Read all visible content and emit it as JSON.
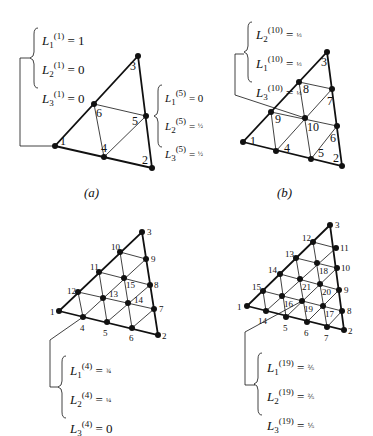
{
  "figures": [
    {
      "id": "a",
      "caption": "(a)",
      "nodes": [
        {
          "label": "1",
          "x": 55,
          "y": 146,
          "lx": 60,
          "ly": 145
        },
        {
          "label": "2",
          "x": 152,
          "y": 168,
          "lx": 142,
          "ly": 164
        },
        {
          "label": "3",
          "x": 138,
          "y": 56,
          "lx": 130,
          "ly": 70
        },
        {
          "label": "4",
          "x": 104,
          "y": 157,
          "lx": 101,
          "ly": 152
        },
        {
          "label": "5",
          "x": 146,
          "y": 116,
          "lx": 132,
          "ly": 125
        },
        {
          "label": "6",
          "x": 94,
          "y": 104,
          "lx": 96,
          "ly": 117
        }
      ],
      "equations_top": [
        {
          "base": "L",
          "sub": "1",
          "sup": "(1)",
          "value": "1"
        },
        {
          "base": "L",
          "sub": "2",
          "sup": "(1)",
          "value": "0"
        },
        {
          "base": "L",
          "sub": "3",
          "sup": "(1)",
          "value": "0"
        }
      ],
      "equations_side": [
        {
          "base": "L",
          "sub": "1",
          "sup": "(5)",
          "value": "0"
        },
        {
          "base": "L",
          "sub": "2",
          "sup": "(5)",
          "value": "½"
        },
        {
          "base": "L",
          "sub": "3",
          "sup": "(5)",
          "value": "½"
        }
      ]
    },
    {
      "id": "b",
      "caption": "(b)",
      "nodes": [
        {
          "label": "1",
          "x": 243,
          "y": 142,
          "lx": 250,
          "ly": 145
        },
        {
          "label": "2",
          "x": 342,
          "y": 166,
          "lx": 333,
          "ly": 162
        },
        {
          "label": "3",
          "x": 327,
          "y": 52,
          "lx": 321,
          "ly": 66
        },
        {
          "label": "4",
          "x": 276,
          "y": 151,
          "lx": 284,
          "ly": 152
        },
        {
          "label": "5",
          "x": 311,
          "y": 159,
          "lx": 318,
          "ly": 157
        },
        {
          "label": "6",
          "x": 337,
          "y": 126,
          "lx": 330,
          "ly": 142
        },
        {
          "label": "7",
          "x": 332,
          "y": 89,
          "lx": 327,
          "ly": 105
        },
        {
          "label": "8",
          "x": 299,
          "y": 82,
          "lx": 303,
          "ly": 93
        },
        {
          "label": "9",
          "x": 271,
          "y": 112,
          "lx": 275,
          "ly": 123
        },
        {
          "label": "10",
          "x": 305,
          "y": 118,
          "lx": 307,
          "ly": 131
        }
      ],
      "equations_top": [
        {
          "base": "L",
          "sub": "2",
          "sup": "(10)",
          "value": "⅓"
        },
        {
          "base": "L",
          "sub": "1",
          "sup": "(10)",
          "value": "⅓"
        },
        {
          "base": "L",
          "sub": "3",
          "sup": "(10)",
          "value": "⅓"
        }
      ]
    },
    {
      "id": "c",
      "caption": "",
      "nodes": [
        {
          "label": "1",
          "x": 59,
          "y": 311,
          "lx": 50,
          "ly": 315
        },
        {
          "label": "2",
          "x": 158,
          "y": 335,
          "lx": 162,
          "ly": 339
        },
        {
          "label": "3",
          "x": 142,
          "y": 232,
          "lx": 147,
          "ly": 235
        },
        {
          "label": "4",
          "x": 83,
          "y": 317,
          "lx": 80,
          "ly": 331
        },
        {
          "label": "5",
          "x": 107,
          "y": 322,
          "lx": 103,
          "ly": 336
        },
        {
          "label": "6",
          "x": 132,
          "y": 328,
          "lx": 129,
          "ly": 341
        },
        {
          "label": "7",
          "x": 154,
          "y": 309,
          "lx": 159,
          "ly": 312
        },
        {
          "label": "8",
          "x": 150,
          "y": 285,
          "lx": 154,
          "ly": 288
        },
        {
          "label": "9",
          "x": 146,
          "y": 259,
          "lx": 151,
          "ly": 262
        },
        {
          "label": "10",
          "x": 120,
          "y": 252,
          "lx": 111,
          "ly": 250
        },
        {
          "label": "11",
          "x": 99,
          "y": 272,
          "lx": 90,
          "ly": 270
        },
        {
          "label": "12",
          "x": 78,
          "y": 292,
          "lx": 67,
          "ly": 294
        },
        {
          "label": "13",
          "x": 103,
          "y": 298,
          "lx": 109,
          "ly": 297
        },
        {
          "label": "14",
          "x": 128,
          "y": 303,
          "lx": 134,
          "ly": 303
        },
        {
          "label": "15",
          "x": 124,
          "y": 278,
          "lx": 126,
          "ly": 288
        }
      ],
      "equations_bottom": [
        {
          "base": "L",
          "sub": "1",
          "sup": "(4)",
          "value": "¾"
        },
        {
          "base": "L",
          "sub": "2",
          "sup": "(4)",
          "value": "¼"
        },
        {
          "base": "L",
          "sub": "3",
          "sup": "(4)",
          "value": "0"
        }
      ]
    },
    {
      "id": "d",
      "caption": "",
      "nodes": [
        {
          "label": "1",
          "x": 247,
          "y": 306,
          "lx": 237,
          "ly": 310
        },
        {
          "label": "2",
          "x": 344,
          "y": 330,
          "lx": 348,
          "ly": 334
        },
        {
          "label": "3",
          "x": 330,
          "y": 225,
          "lx": 335,
          "ly": 228
        },
        {
          "label": "14",
          "x": 266,
          "y": 311,
          "lx": 258,
          "ly": 324
        },
        {
          "label": "5",
          "x": 286,
          "y": 317,
          "lx": 283,
          "ly": 331
        },
        {
          "label": "6",
          "x": 307,
          "y": 322,
          "lx": 304,
          "ly": 336
        },
        {
          "label": "7",
          "x": 327,
          "y": 327,
          "lx": 324,
          "ly": 341
        },
        {
          "label": "8",
          "x": 342,
          "y": 311,
          "lx": 347,
          "ly": 314
        },
        {
          "label": "9",
          "x": 339,
          "y": 290,
          "lx": 344,
          "ly": 293
        },
        {
          "label": "10",
          "x": 337,
          "y": 268,
          "lx": 341,
          "ly": 271
        },
        {
          "label": "11",
          "x": 336,
          "y": 248,
          "lx": 340,
          "ly": 251
        },
        {
          "label": "12",
          "x": 313,
          "y": 242,
          "lx": 302,
          "ly": 241
        },
        {
          "label": "13",
          "x": 296,
          "y": 258,
          "lx": 285,
          "ly": 257
        },
        {
          "label": "14",
          "x": 280,
          "y": 274,
          "lx": 268,
          "ly": 273
        },
        {
          "label": "15",
          "x": 263,
          "y": 291,
          "lx": 252,
          "ly": 290
        },
        {
          "label": "16",
          "x": 282,
          "y": 296,
          "lx": 284,
          "ly": 307
        },
        {
          "label": "17",
          "x": 323,
          "y": 306,
          "lx": 325,
          "ly": 317
        },
        {
          "label": "18",
          "x": 317,
          "y": 263,
          "lx": 319,
          "ly": 274
        },
        {
          "label": "19",
          "x": 302,
          "y": 301,
          "lx": 304,
          "ly": 312
        },
        {
          "label": "20",
          "x": 320,
          "y": 284,
          "lx": 322,
          "ly": 295
        },
        {
          "label": "21",
          "x": 300,
          "y": 279,
          "lx": 302,
          "ly": 290
        }
      ],
      "equations_bottom": [
        {
          "base": "L",
          "sub": "1",
          "sup": "(19)",
          "value": "⅖"
        },
        {
          "base": "L",
          "sub": "2",
          "sup": "(19)",
          "value": "⅖"
        },
        {
          "base": "L",
          "sub": "3",
          "sup": "(19)",
          "value": "⅕"
        }
      ]
    }
  ],
  "colors": {
    "ink": "#111111",
    "paper": "#ffffff"
  }
}
